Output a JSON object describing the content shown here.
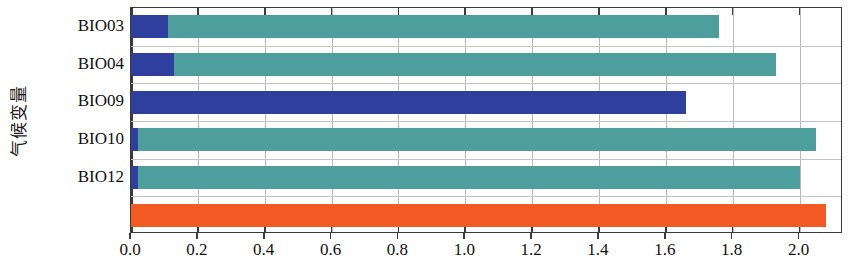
{
  "chart_data": {
    "type": "bar",
    "orientation": "horizontal",
    "title": "",
    "xlabel": "",
    "ylabel": "气候变量",
    "categories": [
      "BIO03",
      "BIO04",
      "BIO09",
      "BIO10",
      "BIO12",
      ""
    ],
    "xlim": [
      0.0,
      2.13
    ],
    "ylim_note": "6 category rows, bottom row unlabeled",
    "grid": true,
    "grid_axis": "x",
    "legend": "none",
    "xticks": [
      0.0,
      0.2,
      0.4,
      0.6,
      0.8,
      1.0,
      1.2,
      1.4,
      1.6,
      1.8,
      2.0
    ],
    "xticklabels": [
      "0.0",
      "0.2",
      "0.4",
      "0.6",
      "0.8",
      "1.0",
      "1.2",
      "1.4",
      "1.6",
      "1.8",
      "2.0"
    ],
    "series": [
      {
        "name": "teal",
        "color": "#4e9e9e",
        "values": [
          1.76,
          1.93,
          1.16,
          2.05,
          2.0,
          0.0
        ]
      },
      {
        "name": "blue",
        "color": "#2f3f9e",
        "values": [
          0.11,
          0.13,
          1.66,
          0.02,
          0.02,
          0.0
        ]
      },
      {
        "name": "orange",
        "color": "#f15a22",
        "values": [
          0.0,
          0.0,
          0.0,
          0.0,
          0.0,
          2.08
        ]
      }
    ],
    "bars": [
      {
        "category": "BIO03",
        "teal": 1.76,
        "blue": 0.11,
        "orange": 0.0
      },
      {
        "category": "BIO04",
        "teal": 1.93,
        "blue": 0.13,
        "orange": 0.0
      },
      {
        "category": "BIO09",
        "teal": 1.16,
        "blue": 1.66,
        "orange": 0.0
      },
      {
        "category": "BIO10",
        "teal": 2.05,
        "blue": 0.02,
        "orange": 0.0
      },
      {
        "category": "BIO12",
        "teal": 2.0,
        "blue": 0.02,
        "orange": 0.0
      },
      {
        "category": "",
        "teal": 0.0,
        "blue": 0.0,
        "orange": 2.08
      }
    ],
    "colors": {
      "teal": "#4e9e9e",
      "blue": "#2f3f9e",
      "orange": "#f15a22",
      "axis": "#3a3a3a",
      "grid": "#b9b9b9"
    }
  }
}
